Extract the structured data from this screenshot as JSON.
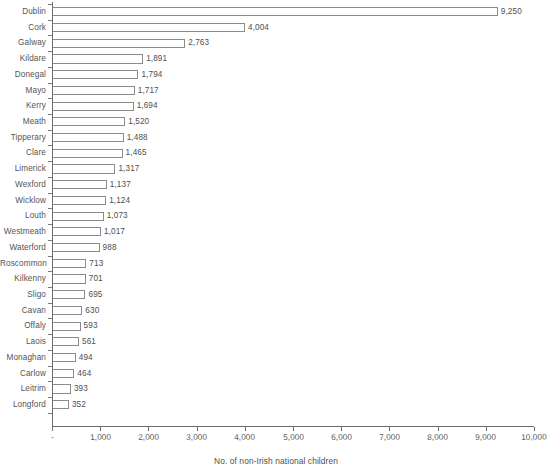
{
  "chart_data": {
    "type": "bar",
    "orientation": "horizontal",
    "title": "",
    "subtitle": "",
    "xlabel": "No. of non-Irish national children",
    "ylabel": "",
    "xlim": [
      0,
      10000
    ],
    "grid": false,
    "legend": null,
    "x_tick_labels": [
      "-",
      "1,000",
      "2,000",
      "3,000",
      "4,000",
      "5,000",
      "6,000",
      "7,000",
      "8,000",
      "9,000",
      "10,000"
    ],
    "x_tick_values": [
      0,
      1000,
      2000,
      3000,
      4000,
      5000,
      6000,
      7000,
      8000,
      9000,
      10000
    ],
    "categories": [
      "Dublin",
      "Cork",
      "Galway",
      "Kildare",
      "Donegal",
      "Mayo",
      "Kerry",
      "Meath",
      "Tipperary",
      "Clare",
      "Limerick",
      "Wexford",
      "Wicklow",
      "Louth",
      "Westmeath",
      "Waterford",
      "Roscommon",
      "Kilkenny",
      "Sligo",
      "Cavan",
      "Offaly",
      "Laois",
      "Monaghan",
      "Carlow",
      "Leitrim",
      "Longford"
    ],
    "values": [
      9250,
      4004,
      2763,
      1891,
      1794,
      1717,
      1694,
      1520,
      1488,
      1465,
      1317,
      1137,
      1124,
      1073,
      1017,
      988,
      713,
      701,
      695,
      630,
      593,
      561,
      494,
      464,
      393,
      352
    ],
    "value_labels": [
      "9,250",
      "4,004",
      "2,763",
      "1,891",
      "1,794",
      "1,717",
      "1,694",
      "1,520",
      "1,488",
      "1,465",
      "1,317",
      "1,137",
      "1,124",
      "1,073",
      "1,017",
      "988",
      "713",
      "701",
      "695",
      "630",
      "593",
      "561",
      "494",
      "464",
      "393",
      "352"
    ],
    "colors": {
      "bar_fill": "#ffffff",
      "bar_stroke": "#8c8c8c",
      "axis": "#6e6e6e",
      "text": "#4f4f4f",
      "background": "#ffffff"
    }
  }
}
